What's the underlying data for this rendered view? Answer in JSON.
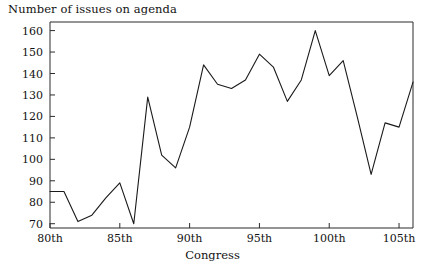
{
  "chart_data": {
    "type": "line",
    "title": "Number of issues on agenda",
    "xlabel": "Congress",
    "ylabel": "",
    "x": [
      80,
      81,
      82,
      83,
      84,
      85,
      86,
      87,
      88,
      89,
      90,
      91,
      92,
      93,
      94,
      95,
      96,
      97,
      98,
      99,
      100,
      101,
      102,
      103,
      104,
      105,
      106
    ],
    "values": [
      85,
      85,
      71,
      74,
      82,
      89,
      70,
      129,
      102,
      96,
      115,
      144,
      135,
      133,
      137,
      149,
      143,
      127,
      137,
      160,
      139,
      146,
      120,
      93,
      117,
      115,
      136
    ],
    "series": [
      {
        "name": "Number of issues on agenda",
        "values": [
          85,
          85,
          71,
          74,
          82,
          89,
          70,
          129,
          102,
          96,
          115,
          144,
          135,
          133,
          137,
          149,
          143,
          127,
          137,
          160,
          139,
          146,
          120,
          93,
          117,
          115,
          136
        ]
      }
    ],
    "xlim": [
      80,
      106
    ],
    "ylim": [
      68,
      164
    ],
    "ytick_values": [
      70,
      80,
      90,
      100,
      110,
      120,
      130,
      140,
      150,
      160
    ],
    "ytick_labels": [
      "70",
      "80",
      "90",
      "100",
      "110",
      "120",
      "130",
      "140",
      "150",
      "160"
    ],
    "xtick_values": [
      80,
      85,
      90,
      95,
      100,
      105
    ],
    "xtick_labels": [
      "80th",
      "85th",
      "90th",
      "95th",
      "100th",
      "105th"
    ],
    "grid": false,
    "legend": false,
    "legend_position": "none",
    "line_color": "#1a1a1a",
    "axis_color": "#2b2b2b",
    "background_color": "#ffffff"
  }
}
